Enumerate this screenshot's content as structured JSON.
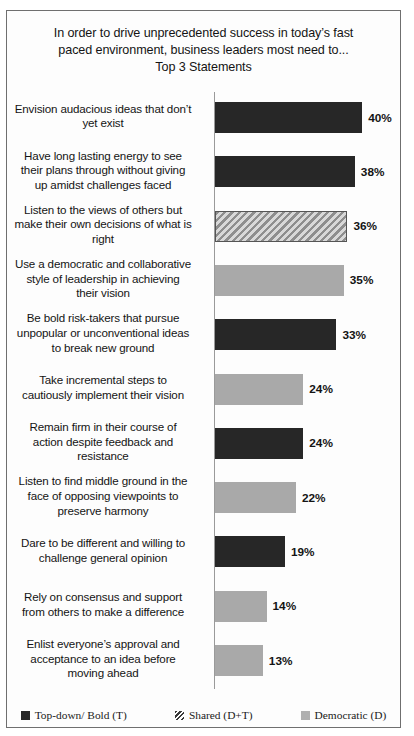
{
  "chart_data": {
    "type": "bar",
    "orientation": "horizontal",
    "title": "In order to drive unprecedented success in today’s fast paced environment, business leaders most need to...\nTop 3 Statements",
    "title_lines": [
      "In order to drive unprecedented success in today’s fast",
      "paced environment, business leaders most need to...",
      "Top 3 Statements"
    ],
    "xlabel": "",
    "ylabel": "",
    "xlim": [
      0,
      40
    ],
    "grid": false,
    "value_suffix": "%",
    "legend_position": "bottom",
    "categories": [
      "Envision audacious ideas that don’t yet exist",
      "Have long lasting energy to see their plans through without giving up amidst challenges faced",
      "Listen to the views of others but make their own decisions of what is right",
      "Use a democratic and collaborative style of leadership  in achieving their vision",
      "Be bold risk-takers  that pursue unpopular or unconventional ideas to break new ground",
      "Take incremental steps to cautiously implement their vision",
      "Remain firm in their course of action despite feedback and resistance",
      "Listen to find middle ground in the face of opposing viewpoints  to preserve harmony",
      "Dare to be different and willing to challenge  general opinion",
      "Rely on consensus and support from others to make a difference",
      "Enlist everyone’s approval and acceptance to an idea before moving ahead"
    ],
    "values": [
      40,
      38,
      36,
      35,
      33,
      24,
      24,
      22,
      19,
      14,
      13
    ],
    "value_labels": [
      "40%",
      "38%",
      "36%",
      "35%",
      "33%",
      "24%",
      "24%",
      "22%",
      "19%",
      "14%",
      "13%"
    ],
    "series_keys": [
      "topdown",
      "topdown",
      "shared",
      "democratic",
      "topdown",
      "democratic",
      "topdown",
      "democratic",
      "topdown",
      "democratic",
      "democratic"
    ],
    "bars": [
      {
        "label": "Envision audacious ideas that don’t yet exist",
        "label_lines": [
          "Envision audacious ideas that don’t",
          "yet exist"
        ],
        "value": 40,
        "value_label": "40%",
        "series": "topdown"
      },
      {
        "label": "Have long lasting energy to see their plans through without giving up amidst challenges faced",
        "label_lines": [
          "Have long lasting energy to see",
          "their plans through without giving",
          "up amidst challenges faced"
        ],
        "value": 38,
        "value_label": "38%",
        "series": "topdown"
      },
      {
        "label": "Listen to the views of others but make their own decisions of what is right",
        "label_lines": [
          "Listen to the views of others but",
          "make their own decisions of what is",
          "right"
        ],
        "value": 36,
        "value_label": "36%",
        "series": "shared"
      },
      {
        "label": "Use a democratic and collaborative style of leadership  in achieving their vision",
        "label_lines": [
          "Use a democratic and collaborative",
          "style of leadership  in achieving",
          "their vision"
        ],
        "value": 35,
        "value_label": "35%",
        "series": "democratic"
      },
      {
        "label": "Be bold risk-takers  that pursue unpopular or unconventional ideas to break new ground",
        "label_lines": [
          "Be bold risk-takers  that pursue",
          "unpopular or unconventional ideas",
          "to break new ground"
        ],
        "value": 33,
        "value_label": "33%",
        "series": "topdown"
      },
      {
        "label": "Take incremental steps to cautiously implement their vision",
        "label_lines": [
          "Take incremental steps to",
          "cautiously implement their vision"
        ],
        "value": 24,
        "value_label": "24%",
        "series": "democratic"
      },
      {
        "label": "Remain firm in their course of action despite feedback and resistance",
        "label_lines": [
          "Remain firm in their course of",
          "action despite feedback and",
          "resistance"
        ],
        "value": 24,
        "value_label": "24%",
        "series": "topdown"
      },
      {
        "label": "Listen to find middle ground in the face of opposing viewpoints  to preserve harmony",
        "label_lines": [
          "Listen to find middle ground in the",
          "face of opposing viewpoints  to",
          "preserve harmony"
        ],
        "value": 22,
        "value_label": "22%",
        "series": "democratic"
      },
      {
        "label": "Dare to be different and willing to challenge  general opinion",
        "label_lines": [
          "Dare to be different and willing to",
          "challenge  general opinion"
        ],
        "value": 19,
        "value_label": "19%",
        "series": "topdown"
      },
      {
        "label": "Rely on consensus and support from others to make a difference",
        "label_lines": [
          "Rely on consensus and support",
          "from others to make a difference"
        ],
        "value": 14,
        "value_label": "14%",
        "series": "democratic"
      },
      {
        "label": "Enlist everyone’s approval and acceptance to an idea before moving ahead",
        "label_lines": [
          "Enlist everyone’s approval and",
          "acceptance to an idea before",
          "moving ahead"
        ],
        "value": 13,
        "value_label": "13%",
        "series": "democratic"
      }
    ],
    "legend": [
      {
        "label": "Top-down/ Bold (T)",
        "key": "topdown",
        "color": "#272727"
      },
      {
        "label": "Shared (D+T)",
        "key": "shared",
        "color": "#8e8e8e"
      },
      {
        "label": "Democratic (D)",
        "key": "democratic",
        "color": "#a9a9a9"
      }
    ]
  },
  "colors": {
    "topdown": "#272727",
    "shared": "#8e8e8e",
    "democratic": "#a9a9a9",
    "axis": "#9a9a9a",
    "border": "#6f6f6f",
    "text": "#141414",
    "background": "#fdfdfd"
  }
}
